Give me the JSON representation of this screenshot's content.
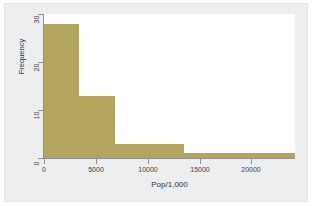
{
  "figure": {
    "background_color": "#eceef0",
    "plot_background_color": "#ffffff",
    "bar_color": "#b3a45e",
    "axis_color": "#8c9096"
  },
  "chart_data": {
    "type": "bar",
    "title": "",
    "subtitle": "",
    "xlabel": "Pop/1,000",
    "ylabel": "Frequency",
    "xlim": [
      0,
      24200
    ],
    "ylim": [
      0,
      30
    ],
    "xticks": [
      0,
      5000,
      10000,
      15000,
      20000
    ],
    "xtick_labels": [
      "0",
      "5000",
      "10000",
      "15000",
      "20000"
    ],
    "yticks": [
      0,
      10,
      20,
      30
    ],
    "ytick_labels": [
      "0",
      "10",
      "20",
      "30"
    ],
    "grid": false,
    "legend": null,
    "legend_position": "none",
    "bin_edges": [
      0,
      3400,
      6800,
      13500,
      24200
    ],
    "bins": [
      {
        "label": "0-3400",
        "x0": 0,
        "x1": 3400,
        "value": 28
      },
      {
        "label": "3400-6800",
        "x0": 3400,
        "x1": 6800,
        "value": 13
      },
      {
        "label": "6800-13500",
        "x0": 6800,
        "x1": 13500,
        "value": 3
      },
      {
        "label": "13500-24200",
        "x0": 13500,
        "x1": 24200,
        "value": 1
      }
    ],
    "categories": [
      "0-3400",
      "3400-6800",
      "6800-13500",
      "13500-24200"
    ],
    "values": [
      28,
      13,
      3,
      1
    ]
  }
}
